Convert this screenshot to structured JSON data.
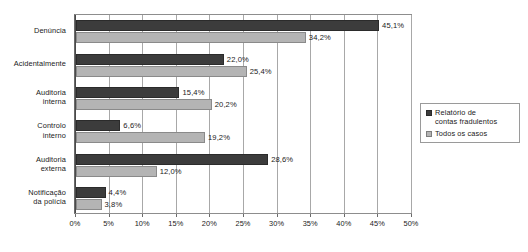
{
  "chart_data": {
    "type": "bar",
    "orientation": "horizontal",
    "title": "",
    "subtitle": "",
    "xlabel": "",
    "ylabel": "",
    "xlim": [
      0,
      50
    ],
    "xunit": "%",
    "grid": true,
    "legend_position": "right",
    "categories": [
      "Denúncia",
      "Acidentalmente",
      "Auditoria interna",
      "Controlo interno",
      "Auditoria externa",
      "Notificação da polícia"
    ],
    "category_lines": [
      [
        "Denúncia"
      ],
      [
        "Acidentalmente"
      ],
      [
        "Auditoria",
        "interna"
      ],
      [
        "Controlo",
        "interno"
      ],
      [
        "Auditoria",
        "externa"
      ],
      [
        "Notificação",
        "da polícia"
      ]
    ],
    "series": [
      {
        "name": "Relatório de contas fradulentos",
        "name_lines": [
          "Relatório de",
          "contas fradulentos"
        ],
        "color": "#3c3c3c",
        "values": [
          45.1,
          22.0,
          15.4,
          6.6,
          28.6,
          4.4
        ],
        "labels": [
          "45,1%",
          "22,0%",
          "15,4%",
          "6,6%",
          "28,6%",
          "4,4%"
        ]
      },
      {
        "name": "Todos os casos",
        "name_lines": [
          "Todos os casos"
        ],
        "color": "#b4b4b4",
        "values": [
          34.2,
          25.4,
          20.2,
          19.2,
          12.0,
          3.8
        ],
        "labels": [
          "34,2%",
          "25,4%",
          "20,2%",
          "19,2%",
          "12,0%",
          "3,8%"
        ]
      }
    ],
    "xticks": [
      0,
      5,
      10,
      15,
      20,
      25,
      30,
      35,
      40,
      45,
      50
    ],
    "xtick_labels": [
      "0%",
      "5%",
      "10%",
      "15%",
      "20%",
      "25%",
      "30%",
      "35%",
      "40%",
      "45%",
      "50%"
    ]
  },
  "legend": {
    "items": [
      {
        "label": "Relatório de contas fradulentos",
        "color": "#3c3c3c"
      },
      {
        "label": "Todos os casos",
        "color": "#b4b4b4"
      }
    ]
  }
}
